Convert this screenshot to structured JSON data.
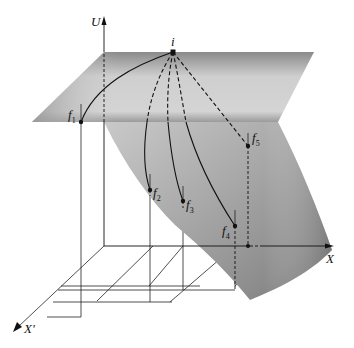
{
  "diagram": {
    "type": "3d-surface-paths",
    "axes": {
      "vertical": "U",
      "horizontal": "X",
      "depth": "X'"
    },
    "points": {
      "initial": "i",
      "finals": [
        {
          "name": "f",
          "sub": "1"
        },
        {
          "name": "f",
          "sub": "2"
        },
        {
          "name": "f",
          "sub": "3"
        },
        {
          "name": "f",
          "sub": "4"
        },
        {
          "name": "f",
          "sub": "5"
        }
      ]
    },
    "colors": {
      "surface_dark": "#7a7a7a",
      "surface_light": "#d8d8d8",
      "line": "#111111",
      "background": "#ffffff"
    }
  }
}
